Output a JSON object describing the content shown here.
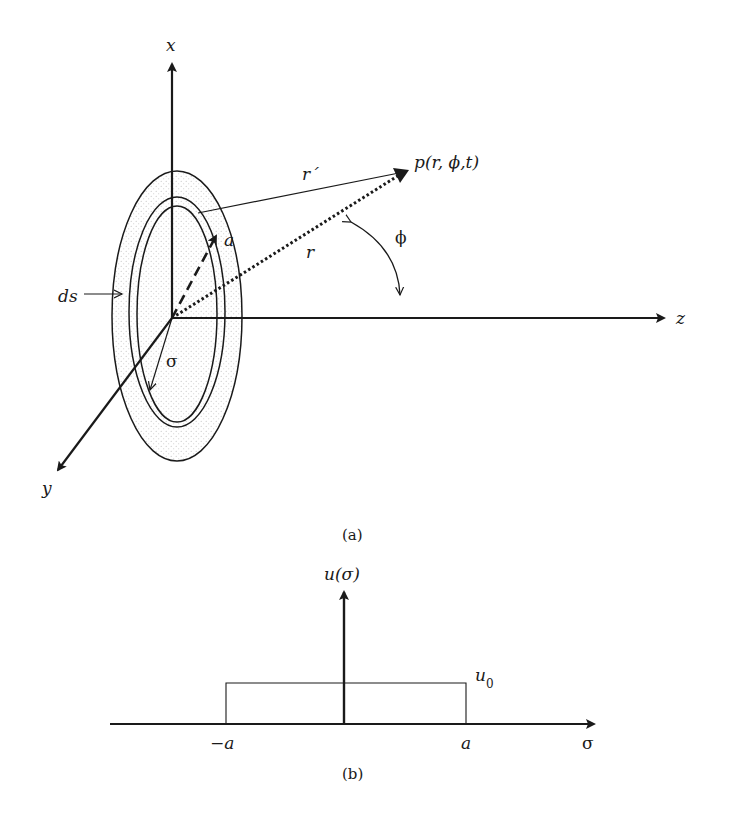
{
  "figure_a": {
    "caption": "(a)",
    "axes": {
      "x": "x",
      "y": "y",
      "z": "z"
    },
    "point_label": "p(r, ϕ,t)",
    "labels": {
      "r_prime": "r´",
      "r": "r",
      "a": "a",
      "phi": "ϕ",
      "ds": "ds",
      "sigma": "σ"
    }
  },
  "figure_b": {
    "caption": "(b)",
    "y_axis_label": "u(σ)",
    "x_axis_label": "σ",
    "level_label": "u0",
    "tick_left": "−a",
    "tick_right": "a"
  },
  "colors": {
    "ink": "#1a1a1a",
    "dots": "#bdbdbd"
  }
}
